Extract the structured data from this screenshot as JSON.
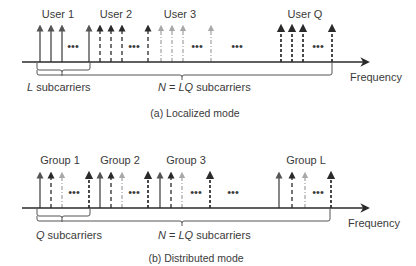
{
  "panels": [
    {
      "id": "localized",
      "caption": "(a) Localized mode",
      "axis_label": "Frequency",
      "group_labels": [
        "User 1",
        "User 2",
        "User 3",
        "User Q"
      ],
      "group_label_prefixes": [
        "User",
        "User",
        "User",
        "User"
      ],
      "group_label_indices": [
        "1",
        "2",
        "3",
        "Q"
      ],
      "small_bracket": {
        "var": "L",
        "text": " subcarriers"
      },
      "big_bracket": {
        "prefix": "N",
        "eq": " = ",
        "var": "LQ",
        "text": " subcarriers"
      },
      "ellipsis": "•••",
      "styles_by_group": [
        "solid",
        "dashed",
        "dashdot-light",
        "heavy-dashed"
      ]
    },
    {
      "id": "distributed",
      "caption": "(b) Distributed mode",
      "axis_label": "Frequency",
      "group_labels": [
        "Group 1",
        "Group 2",
        "Group 3",
        "Group L"
      ],
      "group_label_prefixes": [
        "Group",
        "Group",
        "Group",
        "Group"
      ],
      "group_label_indices": [
        "1",
        "2",
        "3",
        "L"
      ],
      "small_bracket": {
        "var": "Q",
        "text": " subcarriers"
      },
      "big_bracket": {
        "prefix": "N",
        "eq": " = ",
        "var": "LQ",
        "text": " subcarriers"
      },
      "ellipsis": "•••",
      "styles_by_position": [
        "solid",
        "dashed",
        "dashdot-light",
        "heavy-dashed"
      ]
    }
  ],
  "colors": {
    "axis": "#3a3a3a",
    "solid": "#555555",
    "dashed": "#3a3a3a",
    "light": "#a8a8a8",
    "heavy": "#2a2a2a",
    "text": "#3a3a3a"
  }
}
